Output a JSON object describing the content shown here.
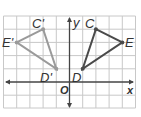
{
  "diagram": {
    "type": "coordinate-plane-reflection",
    "axes": {
      "x_label": "x",
      "y_label": "y",
      "origin_label": "O"
    },
    "grid": {
      "x_range": [
        -5,
        5
      ],
      "y_range": [
        -2,
        5
      ],
      "spacing": 1
    },
    "colors": {
      "original": "#4a4a4a",
      "image": "#9a9a9a",
      "grid": "#c8c8c8",
      "axis": "#444444"
    },
    "triangles": [
      {
        "name": "CDE",
        "vertices": [
          {
            "label": "C",
            "x": 2,
            "y": 4
          },
          {
            "label": "E",
            "x": 4,
            "y": 3
          },
          {
            "label": "D",
            "x": 1,
            "y": 1
          }
        ]
      },
      {
        "name": "C'D'E'",
        "vertices": [
          {
            "label": "C'",
            "x": -2,
            "y": 4
          },
          {
            "label": "E'",
            "x": -4,
            "y": 3
          },
          {
            "label": "D'",
            "x": -1,
            "y": 1
          }
        ]
      }
    ]
  }
}
